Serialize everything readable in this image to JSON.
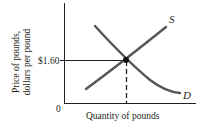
{
  "diagram": {
    "type": "supply-demand",
    "y_axis_label_line1": "Price of pounds,",
    "y_axis_label_line2": "dollars per pound",
    "x_axis_label": "Quantity of pounds",
    "origin_label": "0",
    "price_tick_label": "$1.60",
    "supply_label": "S",
    "demand_label": "D",
    "equilibrium_price": 1.6
  }
}
